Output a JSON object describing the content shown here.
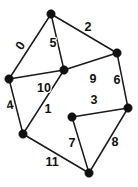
{
  "figure": {
    "background_color": "#ffffff",
    "edge_color": "#1a1a1a",
    "vertex_color": "#111111",
    "label_color": "#111111",
    "width": 138,
    "height": 187
  },
  "graph_data": {
    "type": "diagram",
    "shape": "cube",
    "vertex_count": 8,
    "edge_count": 12,
    "vertices": [
      {
        "id": "A",
        "name": "top-vertex",
        "x": 51,
        "y": 14,
        "r": 4.2
      },
      {
        "id": "B",
        "name": "left-vertex",
        "x": 9,
        "y": 79,
        "r": 4.2
      },
      {
        "id": "C",
        "name": "inner-top-vertex",
        "x": 64,
        "y": 70,
        "r": 4.2
      },
      {
        "id": "D",
        "name": "upper-right-vertex",
        "x": 117,
        "y": 53,
        "r": 4.2
      },
      {
        "id": "E",
        "name": "right-vertex",
        "x": 128,
        "y": 108,
        "r": 4.2
      },
      {
        "id": "F",
        "name": "inner-bottom-vertex",
        "x": 72,
        "y": 117,
        "r": 4.2
      },
      {
        "id": "G",
        "name": "bottom-left-vertex",
        "x": 23,
        "y": 134,
        "r": 4.2
      },
      {
        "id": "H",
        "name": "bottom-vertex",
        "x": 89,
        "y": 173,
        "r": 4.2
      }
    ],
    "edges": [
      {
        "label": "0",
        "from": "A",
        "to": "B",
        "x1": 51,
        "y1": 14,
        "x2": 9,
        "y2": 79,
        "lx": 21,
        "ly": 46,
        "rot": -56
      },
      {
        "label": "2",
        "from": "A",
        "to": "D",
        "x1": 51,
        "y1": 14,
        "x2": 117,
        "y2": 53,
        "lx": 88,
        "ly": 28,
        "rot": 0
      },
      {
        "label": "5",
        "from": "A",
        "to": "C",
        "x1": 51,
        "y1": 14,
        "x2": 64,
        "y2": 70,
        "lx": 53,
        "ly": 44,
        "rot": 0
      },
      {
        "label": "6",
        "from": "D",
        "to": "E",
        "x1": 117,
        "y1": 53,
        "x2": 128,
        "y2": 108,
        "lx": 117,
        "ly": 81,
        "rot": 0
      },
      {
        "label": "9",
        "from": "C",
        "to": "D",
        "x1": 64,
        "y1": 70,
        "x2": 117,
        "y2": 53,
        "lx": 93,
        "ly": 80,
        "rot": 0
      },
      {
        "label": "10",
        "from": "B",
        "to": "C",
        "x1": 9,
        "y1": 79,
        "x2": 64,
        "y2": 70,
        "lx": 44,
        "ly": 89,
        "rot": 0
      },
      {
        "label": "4",
        "from": "B",
        "to": "G",
        "x1": 9,
        "y1": 79,
        "x2": 23,
        "y2": 134,
        "lx": 10,
        "ly": 106,
        "rot": -10
      },
      {
        "label": "3",
        "from": "F",
        "to": "E",
        "x1": 72,
        "y1": 117,
        "x2": 128,
        "y2": 108,
        "lx": 94,
        "ly": 101,
        "rot": 0
      },
      {
        "label": "1",
        "from": "G",
        "to": "C",
        "x1": 23,
        "y1": 134,
        "x2": 64,
        "y2": 70,
        "lx": 48,
        "ly": 110,
        "rot": 0
      },
      {
        "label": "7",
        "from": "F",
        "to": "H",
        "x1": 72,
        "y1": 117,
        "x2": 89,
        "y2": 173,
        "lx": 72,
        "ly": 144,
        "rot": 0
      },
      {
        "label": "8",
        "from": "E",
        "to": "H",
        "x1": 128,
        "y1": 108,
        "x2": 89,
        "y2": 173,
        "lx": 115,
        "ly": 143,
        "rot": 0
      },
      {
        "label": "11",
        "from": "G",
        "to": "H",
        "x1": 23,
        "y1": 134,
        "x2": 89,
        "y2": 173,
        "lx": 52,
        "ly": 163,
        "rot": 0
      }
    ]
  }
}
